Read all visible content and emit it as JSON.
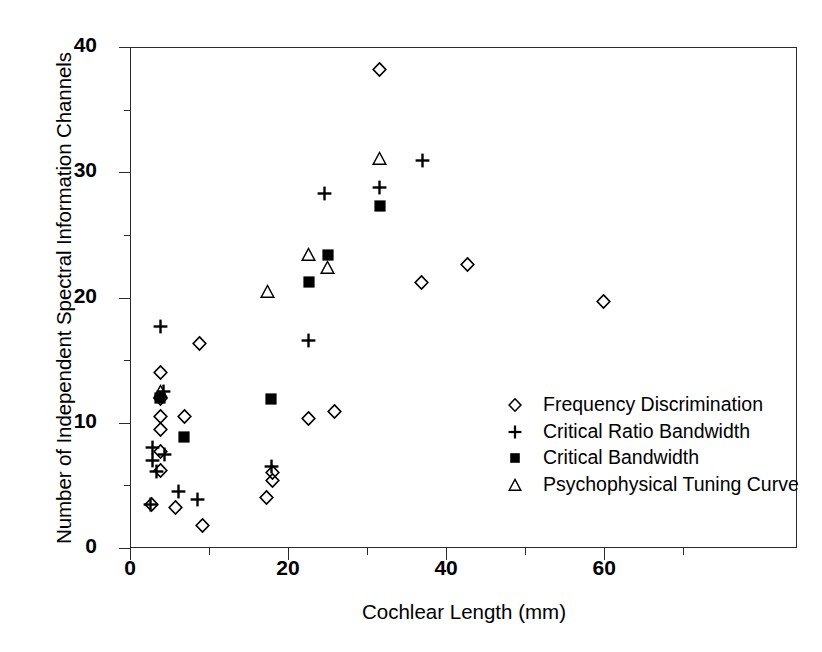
{
  "chart_data": {
    "type": "scatter",
    "title": "",
    "xlabel": "Cochlear Length (mm)",
    "ylabel": "Number of Independent Spectral Information Channels",
    "xlim": [
      0,
      84.4
    ],
    "ylim": [
      0,
      40
    ],
    "xticks": [
      0,
      20,
      40,
      60
    ],
    "xticklabels": [
      "0",
      "20",
      "40",
      "60"
    ],
    "xminorticks": [
      10,
      30,
      50,
      70
    ],
    "yticks": [
      0,
      10,
      20,
      30,
      40
    ],
    "yticklabels": [
      "0",
      "10",
      "20",
      "30",
      "40"
    ],
    "yminorticks": [
      5,
      15,
      25,
      35
    ],
    "grid": false,
    "legend_position": "center-right",
    "series": [
      {
        "name": "Frequency Discrimination",
        "marker": "open-diamond",
        "color": "#000000",
        "points": [
          [
            2.7,
            3.5
          ],
          [
            3.8,
            14.0
          ],
          [
            3.8,
            11.9
          ],
          [
            3.9,
            10.5
          ],
          [
            3.9,
            9.5
          ],
          [
            3.9,
            7.7
          ],
          [
            3.9,
            6.2
          ],
          [
            5.8,
            3.2
          ],
          [
            6.9,
            10.5
          ],
          [
            8.8,
            16.3
          ],
          [
            9.2,
            1.8
          ],
          [
            17.3,
            4.0
          ],
          [
            18.0,
            5.4
          ],
          [
            18.0,
            6.0
          ],
          [
            22.6,
            10.3
          ],
          [
            25.9,
            10.9
          ],
          [
            31.6,
            38.2
          ],
          [
            36.9,
            21.2
          ],
          [
            42.7,
            22.6
          ],
          [
            59.9,
            19.7
          ]
        ]
      },
      {
        "name": "Critical Ratio Bandwidth",
        "marker": "plus",
        "color": "#000000",
        "points": [
          [
            2.6,
            3.5
          ],
          [
            2.9,
            8.0
          ],
          [
            2.9,
            7.0
          ],
          [
            3.4,
            6.1
          ],
          [
            3.9,
            17.7
          ],
          [
            4.3,
            12.5
          ],
          [
            4.4,
            7.5
          ],
          [
            6.2,
            4.5
          ],
          [
            8.5,
            3.9
          ],
          [
            17.9,
            6.5
          ],
          [
            22.6,
            16.6
          ],
          [
            24.6,
            28.3
          ],
          [
            31.6,
            28.8
          ],
          [
            37.0,
            30.9
          ]
        ]
      },
      {
        "name": "Critical Bandwidth",
        "marker": "filled-square",
        "color": "#000000",
        "points": [
          [
            3.8,
            12.0
          ],
          [
            6.8,
            8.9
          ],
          [
            17.8,
            11.9
          ],
          [
            22.6,
            21.2
          ],
          [
            25.0,
            23.4
          ],
          [
            31.6,
            27.3
          ]
        ]
      },
      {
        "name": "Psychophysical Tuning Curve",
        "marker": "open-triangle",
        "color": "#000000",
        "points": [
          [
            3.9,
            12.5
          ],
          [
            17.4,
            20.5
          ],
          [
            22.6,
            23.4
          ],
          [
            25.0,
            22.4
          ],
          [
            31.6,
            31.1
          ]
        ]
      }
    ]
  },
  "legend": {
    "items": [
      {
        "marker": "open-diamond",
        "label": "Frequency Discrimination"
      },
      {
        "marker": "plus",
        "label": "Critical Ratio Bandwidth"
      },
      {
        "marker": "filled-square",
        "label": "Critical Bandwidth"
      },
      {
        "marker": "open-triangle",
        "label": "Psychophysical Tuning Curve"
      }
    ]
  },
  "axes": {
    "x_title": "Cochlear Length (mm)",
    "y_title": "Number of Independent Spectral Information Channels"
  },
  "colors": {
    "ink": "#000000",
    "frame": "#2b2b2b",
    "background": "#ffffff"
  }
}
